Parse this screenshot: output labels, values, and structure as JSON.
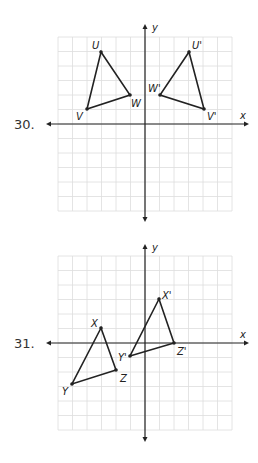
{
  "problems": [
    {
      "number": "30.",
      "axis_labels": {
        "x": "x",
        "y": "y"
      },
      "grid": {
        "min": -6,
        "max": 6
      },
      "original": {
        "points": [
          {
            "name": "U",
            "x": -3,
            "y": 5
          },
          {
            "name": "V",
            "x": -4,
            "y": 1
          },
          {
            "name": "W",
            "x": -1,
            "y": 2
          }
        ]
      },
      "image": {
        "points": [
          {
            "name": "U'",
            "x": 3,
            "y": 5
          },
          {
            "name": "V'",
            "x": 4,
            "y": 1
          },
          {
            "name": "W'",
            "x": 1,
            "y": 2
          }
        ]
      }
    },
    {
      "number": "31.",
      "axis_labels": {
        "x": "x",
        "y": "y"
      },
      "grid": {
        "min": -6,
        "max": 6
      },
      "original": {
        "points": [
          {
            "name": "X",
            "x": -3,
            "y": 1
          },
          {
            "name": "Y",
            "x": -5,
            "y": -3
          },
          {
            "name": "Z",
            "x": -2,
            "y": -2
          }
        ]
      },
      "image": {
        "points": [
          {
            "name": "X'",
            "x": 1,
            "y": 3
          },
          {
            "name": "Y'",
            "x": -1,
            "y": -1
          },
          {
            "name": "Z'",
            "x": 2,
            "y": 0
          }
        ]
      }
    }
  ]
}
